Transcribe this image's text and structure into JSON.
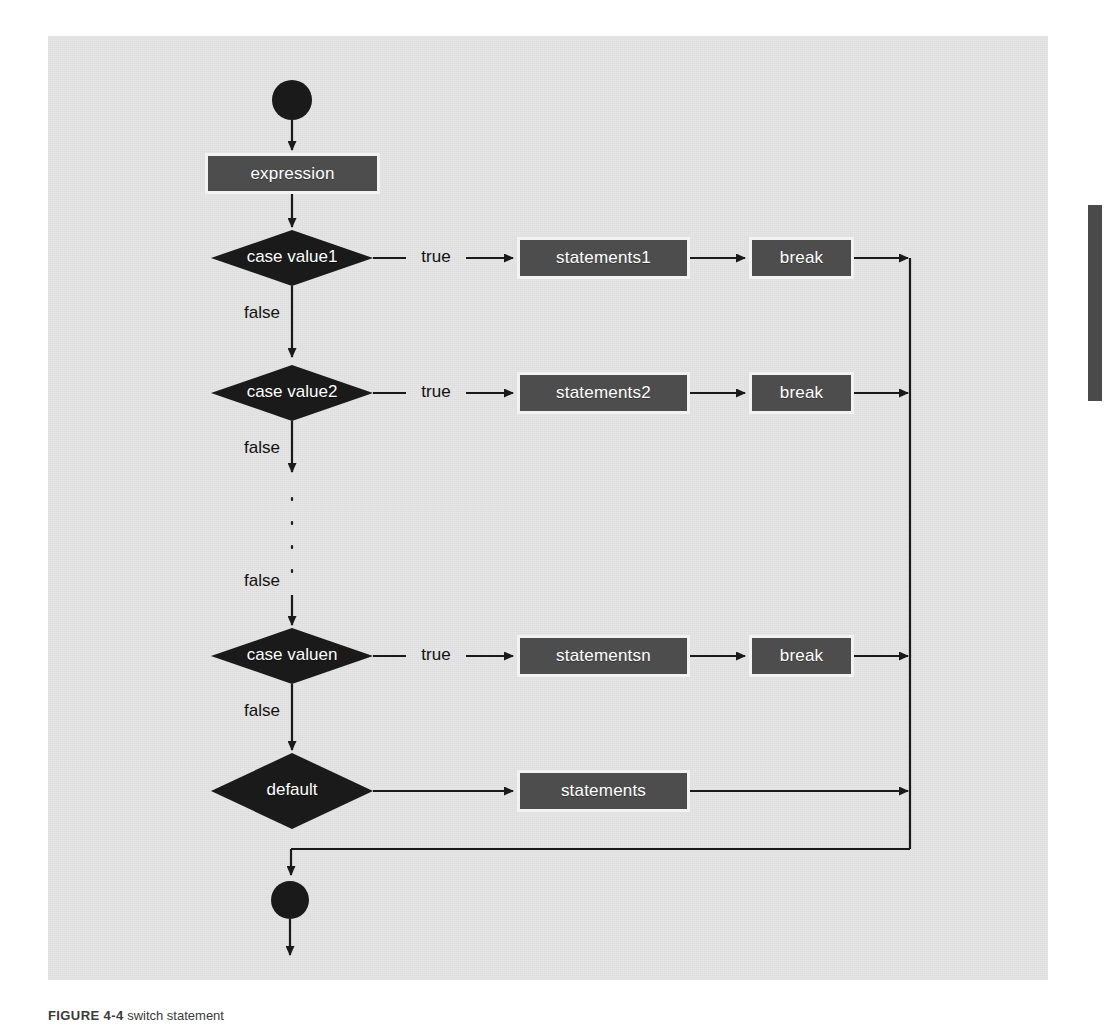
{
  "figure": {
    "caption_lead": "FIGURE 4-4",
    "caption_text": "switch statement",
    "colors": {
      "panel_bg": "#e6e6e6",
      "box_fill": "#4d4d4d",
      "box_border": "#f2f2f2",
      "diamond_fill": "#1a1a1a",
      "line": "#1a1a1a",
      "text_on_dark": "#ffffff",
      "text_on_light": "#111111",
      "edge_tab": "#4a4a4a"
    }
  },
  "diagram": {
    "type": "flowchart",
    "start_node": "start",
    "end_node": "end",
    "process_boxes": [
      {
        "id": "expression",
        "label": "expression"
      },
      {
        "id": "statements1",
        "label": "statements1"
      },
      {
        "id": "break1",
        "label": "break"
      },
      {
        "id": "statements2",
        "label": "statements2"
      },
      {
        "id": "break2",
        "label": "break"
      },
      {
        "id": "statementsn",
        "label": "statementsn"
      },
      {
        "id": "breakn",
        "label": "break"
      },
      {
        "id": "statements",
        "label": "statements"
      }
    ],
    "decisions": [
      {
        "id": "case1",
        "label": "case value1"
      },
      {
        "id": "case2",
        "label": "case value2"
      },
      {
        "id": "casen",
        "label": "case valuen"
      },
      {
        "id": "default",
        "label": "default"
      }
    ],
    "edge_labels": {
      "true1": "true",
      "false1": "false",
      "true2": "true",
      "false2": "false",
      "false_dots": "false",
      "truen": "true",
      "falsen": "false"
    },
    "ellipsis": "⋮"
  }
}
